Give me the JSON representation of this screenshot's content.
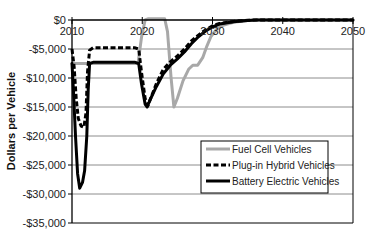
{
  "chart_data": {
    "type": "line",
    "title": "",
    "xlabel": "",
    "ylabel": "Dollars per Vehicle",
    "xlim": [
      2010,
      2050
    ],
    "ylim": [
      -35000,
      0
    ],
    "x_ticks": [
      2010,
      2020,
      2030,
      2040,
      2050
    ],
    "x_tick_labels": [
      "2010",
      "2020",
      "2030",
      "2040",
      "2050"
    ],
    "y_ticks": [
      0,
      -5000,
      -10000,
      -15000,
      -20000,
      -25000,
      -30000,
      -35000
    ],
    "y_tick_labels": [
      "$0",
      "-$5,000",
      "-$10,000",
      "-$15,000",
      "-$20,000",
      "-$25,000",
      "-$30,000",
      "-$35,000"
    ],
    "grid": {
      "horizontal": true,
      "vertical": false
    },
    "x_axis_position": "top",
    "legend_position": "lower right, inside plot",
    "series": [
      {
        "name": "Fuel Cell Vehicles",
        "color": "#a8a8a8",
        "style": "solid",
        "points": [
          [
            2010,
            -7500
          ],
          [
            2019.4,
            -7500
          ],
          [
            2019.9,
            -3000
          ],
          [
            2020.4,
            0
          ],
          [
            2020.8,
            200
          ],
          [
            2023.2,
            200
          ],
          [
            2023.6,
            -2000
          ],
          [
            2024.1,
            -10000
          ],
          [
            2024.5,
            -15000
          ],
          [
            2025.0,
            -13500
          ],
          [
            2025.8,
            -10500
          ],
          [
            2026.6,
            -8500
          ],
          [
            2027.2,
            -7800
          ],
          [
            2027.9,
            -7800
          ],
          [
            2028.6,
            -6500
          ],
          [
            2029.2,
            -4500
          ],
          [
            2029.8,
            -2800
          ],
          [
            2030.6,
            -1600
          ],
          [
            2031.5,
            -900
          ],
          [
            2033,
            -400
          ],
          [
            2035,
            -100
          ],
          [
            2036.5,
            0
          ],
          [
            2050,
            0
          ]
        ]
      },
      {
        "name": "Plug-in Hybrid Vehicles",
        "color": "#000000",
        "style": "dashed",
        "points": [
          [
            2010,
            -5000
          ],
          [
            2010.3,
            -8000
          ],
          [
            2010.6,
            -13500
          ],
          [
            2010.9,
            -17000
          ],
          [
            2011.3,
            -18300
          ],
          [
            2011.7,
            -18500
          ],
          [
            2012.0,
            -16000
          ],
          [
            2012.2,
            -9000
          ],
          [
            2012.5,
            -5200
          ],
          [
            2013,
            -4800
          ],
          [
            2019.0,
            -4800
          ],
          [
            2019.5,
            -5000
          ],
          [
            2019.9,
            -9000
          ],
          [
            2020.4,
            -13500
          ],
          [
            2020.8,
            -14800
          ],
          [
            2021.2,
            -13500
          ],
          [
            2022,
            -11000
          ],
          [
            2023,
            -8500
          ],
          [
            2024,
            -7200
          ],
          [
            2025,
            -6200
          ],
          [
            2026,
            -5000
          ],
          [
            2027,
            -3600
          ],
          [
            2028,
            -2600
          ],
          [
            2029,
            -1700
          ],
          [
            2030,
            -1000
          ],
          [
            2031,
            -600
          ],
          [
            2033,
            -250
          ],
          [
            2035,
            -50
          ],
          [
            2036,
            0
          ],
          [
            2050,
            0
          ]
        ]
      },
      {
        "name": "Battery Electric Vehicles",
        "color": "#000000",
        "style": "solid",
        "points": [
          [
            2010,
            -7500
          ],
          [
            2010.2,
            -12000
          ],
          [
            2010.5,
            -20000
          ],
          [
            2010.8,
            -26500
          ],
          [
            2011.1,
            -29000
          ],
          [
            2011.5,
            -28000
          ],
          [
            2011.8,
            -26000
          ],
          [
            2012.1,
            -20000
          ],
          [
            2012.3,
            -12000
          ],
          [
            2012.5,
            -7500
          ],
          [
            2013,
            -7300
          ],
          [
            2019.0,
            -7300
          ],
          [
            2019.5,
            -7500
          ],
          [
            2019.9,
            -11000
          ],
          [
            2020.4,
            -14500
          ],
          [
            2020.7,
            -15000
          ],
          [
            2021.1,
            -13800
          ],
          [
            2022,
            -11500
          ],
          [
            2023,
            -9300
          ],
          [
            2024,
            -7800
          ],
          [
            2025,
            -6700
          ],
          [
            2026,
            -5500
          ],
          [
            2027,
            -4100
          ],
          [
            2028,
            -2900
          ],
          [
            2029,
            -1900
          ],
          [
            2030,
            -1200
          ],
          [
            2031,
            -700
          ],
          [
            2033,
            -300
          ],
          [
            2035,
            -80
          ],
          [
            2036.3,
            0
          ],
          [
            2050,
            0
          ]
        ]
      }
    ]
  },
  "y_axis": {
    "title": "Dollars per Vehicle"
  },
  "legend": {
    "items": [
      {
        "label": "Fuel Cell Vehicles",
        "color": "#a8a8a8",
        "style": "solid"
      },
      {
        "label": "Plug-in Hybrid Vehicles",
        "color": "#000000",
        "style": "dashed"
      },
      {
        "label": "Battery Electric Vehicles",
        "color": "#000000",
        "style": "solid"
      }
    ]
  }
}
